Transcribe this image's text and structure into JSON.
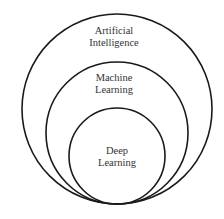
{
  "diagram": {
    "type": "nested-venn",
    "circles": [
      {
        "id": "ai",
        "label_lines": [
          "Artificial",
          "Intelligence"
        ]
      },
      {
        "id": "ml",
        "label_lines": [
          "Machine",
          "Learning"
        ]
      },
      {
        "id": "dl",
        "label_lines": [
          "Deep",
          "Learning"
        ]
      }
    ],
    "stroke_color": "#1a1a1a",
    "background": "#ffffff"
  }
}
